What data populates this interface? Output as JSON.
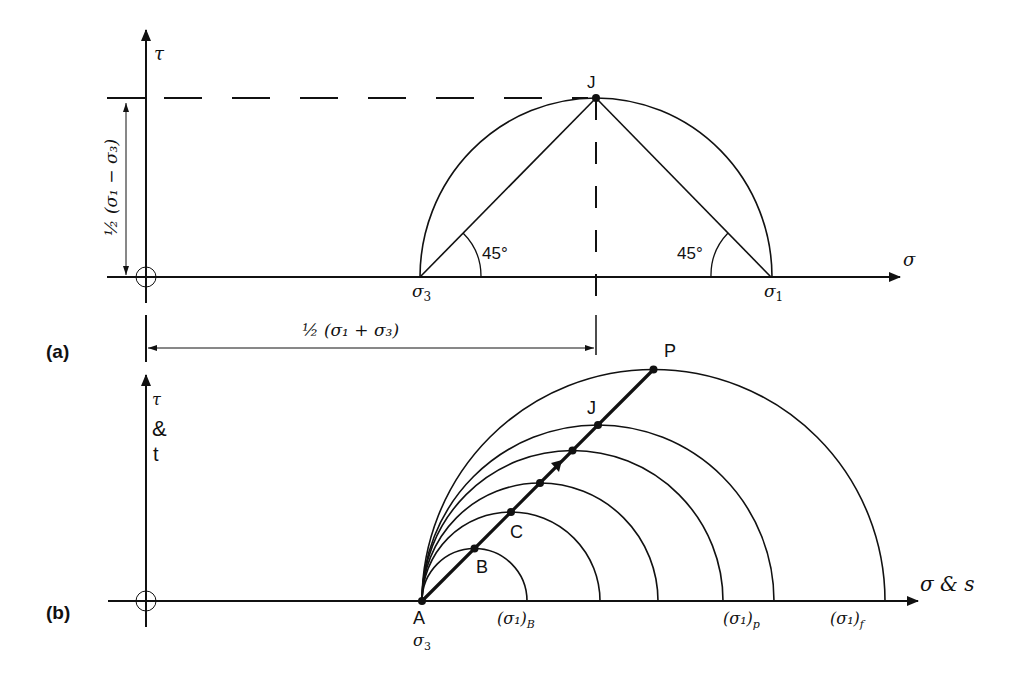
{
  "panel_a": {
    "tag": "(a)",
    "tau_axis_label": "τ",
    "sigma_axis_label": "σ",
    "sigma3_label": "σ",
    "sigma3_sub": "3",
    "sigma1_label": "σ",
    "sigma1_sub": "1",
    "point_label": "J",
    "angle_left": "45°",
    "angle_right": "45°",
    "vertical_dim_label": "½ (σ₁ − σ₃)",
    "horizontal_dim_label": "½ (σ₁ + σ₃)"
  },
  "panel_b": {
    "tag": "(b)",
    "tau_label": "τ",
    "amp_label": "&",
    "t_label": "t",
    "x_axis_label": "σ & s",
    "point_a": "A",
    "point_b": "B",
    "point_c": "C",
    "point_j": "J",
    "point_p": "P",
    "sigma3_label": "σ",
    "sigma3_sub": "3",
    "tick_b": "(σ₁)",
    "tick_b_sub": "B",
    "tick_p": "(σ₁)",
    "tick_p_sub": "p",
    "tick_f": "(σ₁)",
    "tick_f_sub": "f",
    "circle_count": 6,
    "stress_path_angle_deg": 45
  },
  "colors": {
    "ink": "#111111",
    "background": "#ffffff"
  }
}
